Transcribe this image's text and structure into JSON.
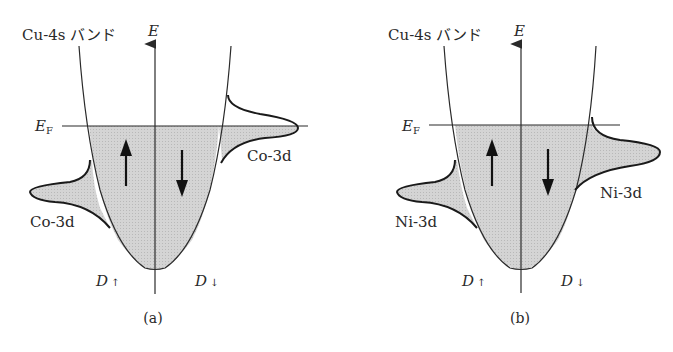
{
  "colors": {
    "ink": "#2a2a2a",
    "fill": "#cfcfcf",
    "background": "#ffffff"
  },
  "panels": [
    {
      "id": "a",
      "caption": "(a)",
      "band_label": "Cu-4s バンド",
      "axis_label": "E",
      "fermi_label": "E",
      "fermi_subscript": "F",
      "left_dos_label": "D",
      "left_dos_arrow": "↑",
      "right_dos_label": "D",
      "right_dos_arrow": "↓",
      "left_lobe_label": "Co-3d",
      "right_lobe_label": "Co-3d",
      "spin_up_arrow": "up-arrow",
      "spin_down_arrow": "down-arrow"
    },
    {
      "id": "b",
      "caption": "(b)",
      "band_label": "Cu-4s バンド",
      "axis_label": "E",
      "fermi_label": "E",
      "fermi_subscript": "F",
      "left_dos_label": "D",
      "left_dos_arrow": "↑",
      "right_dos_label": "D",
      "right_dos_arrow": "↓",
      "left_lobe_label": "Ni-3d",
      "right_lobe_label": "Ni-3d",
      "spin_up_arrow": "up-arrow",
      "spin_down_arrow": "down-arrow"
    }
  ]
}
